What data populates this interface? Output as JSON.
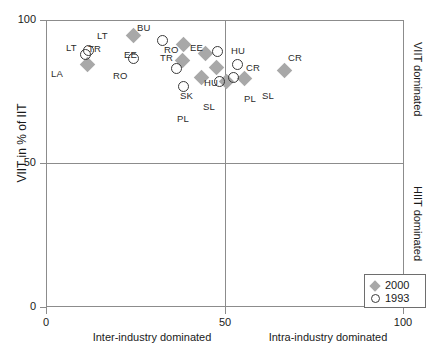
{
  "chart_data": {
    "type": "scatter",
    "title": "",
    "xlabel": "",
    "ylabel": "VIIT in % of IIT",
    "xlim": [
      0,
      100
    ],
    "ylim": [
      0,
      100
    ],
    "xticks": [
      0,
      50,
      100
    ],
    "yticks": [
      0,
      50,
      100
    ],
    "grid": false,
    "quadrant_lines": {
      "x": 50,
      "y": 50
    },
    "x_captions": {
      "left": "Inter-industry dominated",
      "right": "Intra-industry dominated"
    },
    "side_captions": {
      "top": "VIIT dominated",
      "bottom": "HIIT dominated"
    },
    "legend": {
      "position": "bottom-right",
      "entries": [
        {
          "name": "2000",
          "marker": "diamond",
          "color": "#a8a8a8"
        },
        {
          "name": "1993",
          "marker": "circle",
          "color": "#3a3a3a"
        }
      ]
    },
    "series": [
      {
        "name": "2000",
        "marker": "diamond",
        "points": [
          {
            "label": "LT",
            "x": 11.5,
            "y": 84.5
          },
          {
            "label": "BU",
            "x": 24.5,
            "y": 94.5
          },
          {
            "label": "RO",
            "x": 38.5,
            "y": 91.5
          },
          {
            "label": "TR",
            "x": 44.5,
            "y": 88.5
          },
          {
            "label": "EE",
            "x": 38.0,
            "y": 86.0
          },
          {
            "label": "HU",
            "x": 47.5,
            "y": 83.5
          },
          {
            "label": "SK",
            "x": 43.5,
            "y": 80.0
          },
          {
            "label": "PL",
            "x": 50.5,
            "y": 78.5
          },
          {
            "label": "SL",
            "x": 55.5,
            "y": 79.5
          },
          {
            "label": "CR",
            "x": 66.5,
            "y": 82.5
          }
        ]
      },
      {
        "name": "1993",
        "marker": "circle",
        "points": [
          {
            "label": "LT",
            "x": 12.0,
            "y": 89.5
          },
          {
            "label": "LA",
            "x": 11.0,
            "y": 88.0
          },
          {
            "label": "BU",
            "x": 32.5,
            "y": 93.0
          },
          {
            "label": "RO",
            "x": 24.5,
            "y": 86.5
          },
          {
            "label": "EE",
            "x": 48.0,
            "y": 89.0
          },
          {
            "label": "TR",
            "x": 36.5,
            "y": 83.0
          },
          {
            "label": "HU",
            "x": 53.5,
            "y": 84.5
          },
          {
            "label": "SK",
            "x": 52.5,
            "y": 80.0
          },
          {
            "label": "SL",
            "x": 38.5,
            "y": 77.0
          },
          {
            "label": "PL",
            "x": 48.5,
            "y": 78.5
          }
        ]
      }
    ],
    "point_labels": [
      {
        "text": "LT",
        "x": 97,
        "y": 30
      },
      {
        "text": "LT",
        "x": 66,
        "y": 42
      },
      {
        "text": "LA",
        "x": 51,
        "y": 68
      },
      {
        "text": "TR",
        "x": 88,
        "y": 43
      },
      {
        "text": "BU",
        "x": 137,
        "y": 22
      },
      {
        "text": "EE",
        "x": 124,
        "y": 49
      },
      {
        "text": "RO",
        "x": 113,
        "y": 70
      },
      {
        "text": "RO",
        "x": 164,
        "y": 44
      },
      {
        "text": "TR",
        "x": 160,
        "y": 52
      },
      {
        "text": "EE",
        "x": 190,
        "y": 42
      },
      {
        "text": "HU",
        "x": 204,
        "y": 77
      },
      {
        "text": "SK",
        "x": 180,
        "y": 90
      },
      {
        "text": "SL",
        "x": 203,
        "y": 101
      },
      {
        "text": "PL",
        "x": 177,
        "y": 113
      },
      {
        "text": "HU",
        "x": 231,
        "y": 45
      },
      {
        "text": "PL",
        "x": 244,
        "y": 93
      },
      {
        "text": "CR",
        "x": 246,
        "y": 62
      },
      {
        "text": "SL",
        "x": 262,
        "y": 90
      },
      {
        "text": "CR",
        "x": 288,
        "y": 52
      }
    ]
  }
}
